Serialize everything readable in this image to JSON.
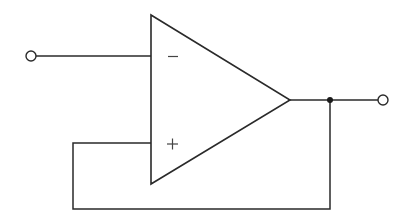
{
  "diagram": {
    "colors": {
      "line": "#2a2a2a",
      "background": "#ffffff",
      "junction": "#1a1a1a"
    },
    "components": {
      "op_amp": {
        "type": "operational-amplifier",
        "inverting_input_symbol": "−",
        "non_inverting_input_symbol": "+"
      },
      "input_terminal": {
        "type": "open-terminal",
        "connects_to": "inverting-input"
      },
      "output_terminal": {
        "type": "open-terminal",
        "connects_to": "output"
      },
      "junction": {
        "type": "node-dot",
        "location": "output"
      },
      "feedback": {
        "type": "wire",
        "from": "output",
        "to": "non-inverting-input"
      }
    }
  }
}
